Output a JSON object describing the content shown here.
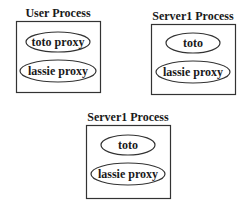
{
  "diagram": {
    "processes": [
      {
        "title": "User Process",
        "components": [
          {
            "label": "toto proxy"
          },
          {
            "label": "lassie proxy"
          }
        ]
      },
      {
        "title": "Server1 Process",
        "components": [
          {
            "label": "toto"
          },
          {
            "label": "lassie proxy"
          }
        ]
      },
      {
        "title": "Server1 Process",
        "components": [
          {
            "label": "toto"
          },
          {
            "label": "lassie proxy"
          }
        ]
      }
    ],
    "colors": {
      "stroke": "#333333",
      "text": "#1a1a1a",
      "background": "#ffffff"
    }
  }
}
